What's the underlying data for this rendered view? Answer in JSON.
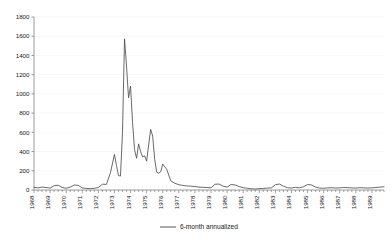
{
  "chart_data": {
    "type": "line",
    "title": "",
    "subtitle": "",
    "xlabel": "",
    "ylabel": "",
    "ylim": [
      0,
      1800
    ],
    "xlim": [
      1968.0,
      1989.75
    ],
    "ytick_labels": [
      "0",
      "200",
      "400",
      "600",
      "800",
      "1000",
      "1200",
      "1400",
      "1600",
      "1800"
    ],
    "ytick_values": [
      0,
      200,
      400,
      600,
      800,
      1000,
      1200,
      1400,
      1600,
      1800
    ],
    "xtick_labels": [
      "1968",
      "1969",
      "1970",
      "1971",
      "1972",
      "1973",
      "1974",
      "1975",
      "1976",
      "1977",
      "1978",
      "1979",
      "1980",
      "1981",
      "1982",
      "1983",
      "1984",
      "1985",
      "1986",
      "1987",
      "1988",
      "1989"
    ],
    "xtick_values": [
      1968,
      1969,
      1970,
      1971,
      1972,
      1973,
      1974,
      1975,
      1976,
      1977,
      1978,
      1979,
      1980,
      1981,
      1982,
      1983,
      1984,
      1985,
      1986,
      1987,
      1988,
      1989
    ],
    "grid": true,
    "grid_axis": "y",
    "legend_position": "bottom-center",
    "line_color": "#444444",
    "axis_color": "#808080",
    "grid_color": "#efefef",
    "background_color": "#ffffff",
    "series": [
      {
        "name": "6-month annualized",
        "x": [
          1968.0,
          1968.25,
          1968.5,
          1968.75,
          1969.0,
          1969.25,
          1969.5,
          1969.75,
          1970.0,
          1970.25,
          1970.5,
          1970.75,
          1971.0,
          1971.25,
          1971.5,
          1971.75,
          1972.0,
          1972.25,
          1972.5,
          1972.75,
          1973.0,
          1973.125,
          1973.25,
          1973.375,
          1973.5,
          1973.625,
          1973.75,
          1973.875,
          1974.0,
          1974.125,
          1974.25,
          1974.375,
          1974.5,
          1974.625,
          1974.75,
          1974.875,
          1975.0,
          1975.125,
          1975.25,
          1975.375,
          1975.5,
          1975.625,
          1975.75,
          1975.875,
          1976.0,
          1976.25,
          1976.5,
          1976.75,
          1977.0,
          1977.25,
          1977.5,
          1977.75,
          1978.0,
          1978.25,
          1978.5,
          1978.75,
          1979.0,
          1979.25,
          1979.5,
          1979.75,
          1980.0,
          1980.25,
          1980.5,
          1980.75,
          1981.0,
          1981.25,
          1981.5,
          1981.75,
          1982.0,
          1982.25,
          1982.5,
          1982.75,
          1983.0,
          1983.25,
          1983.5,
          1983.75,
          1984.0,
          1984.25,
          1984.5,
          1984.75,
          1985.0,
          1985.25,
          1985.5,
          1985.75,
          1986.0,
          1986.25,
          1986.5,
          1986.75,
          1987.0,
          1987.25,
          1987.5,
          1987.75,
          1988.0,
          1988.25,
          1988.5,
          1988.75,
          1989.0,
          1989.25,
          1989.5,
          1989.75
        ],
        "values": [
          28,
          22,
          30,
          26,
          20,
          44,
          50,
          26,
          18,
          30,
          52,
          48,
          22,
          16,
          14,
          18,
          26,
          60,
          58,
          180,
          370,
          255,
          150,
          145,
          600,
          1573,
          1290,
          960,
          1080,
          700,
          420,
          330,
          480,
          400,
          345,
          355,
          300,
          470,
          630,
          560,
          320,
          185,
          175,
          190,
          270,
          215,
          95,
          70,
          55,
          48,
          42,
          40,
          36,
          30,
          28,
          26,
          22,
          60,
          62,
          40,
          30,
          58,
          52,
          36,
          24,
          18,
          12,
          10,
          14,
          16,
          20,
          22,
          55,
          62,
          40,
          24,
          20,
          28,
          22,
          34,
          58,
          52,
          30,
          20,
          18,
          22,
          24,
          20,
          22,
          26,
          24,
          22,
          20,
          24,
          22,
          20,
          22,
          26,
          30,
          34
        ]
      }
    ]
  },
  "legend": {
    "label": "6-month annualized"
  }
}
